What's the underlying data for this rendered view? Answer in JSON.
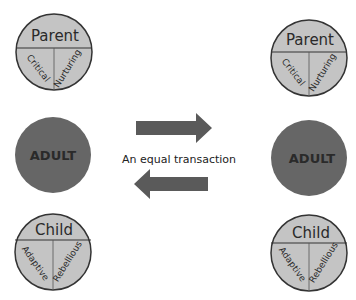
{
  "colors": {
    "ego_state_fill": "#c4c4c4",
    "adult_fill": "#666666",
    "outline": "#333333",
    "arrow": "#5a5a5a",
    "text": "#2a2a2a"
  },
  "left": {
    "parent": {
      "title": "Parent",
      "left": "Critical",
      "right": "Nurturing"
    },
    "adult": {
      "title": "ADULT"
    },
    "child": {
      "title": "Child",
      "left": "Adaptive",
      "right": "Rebellious"
    }
  },
  "right": {
    "parent": {
      "title": "Parent",
      "left": "Critical",
      "right": "Nurturing"
    },
    "adult": {
      "title": "ADULT"
    },
    "child": {
      "title": "Child",
      "left": "Adaptive",
      "right": "Rebellious"
    }
  },
  "transaction": {
    "caption": "An equal transaction",
    "top_arrow": "right",
    "bottom_arrow": "left"
  }
}
